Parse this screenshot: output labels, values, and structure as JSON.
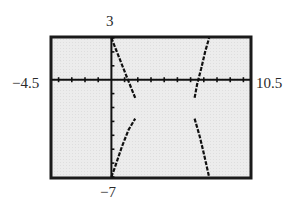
{
  "chart_data": {
    "type": "line",
    "title": "",
    "xlabel": "",
    "ylabel": "",
    "window": {
      "xmin": -4.5,
      "xmax": 10.5,
      "ymin": -7,
      "ymax": 3,
      "xscl": 1,
      "yscl": 1
    },
    "labels": {
      "ymax": "3",
      "ymin": "−7",
      "xmin": "−4.5",
      "xmax": "10.5"
    },
    "grid": false,
    "style": "graphing-calculator screen, dashed/pixelated curves on light gray background",
    "asymptotes_x": [
      1.7,
      6.5
    ],
    "series": [
      {
        "name": "branch-1-upper-left",
        "points": [
          [
            0,
            3
          ],
          [
            0.5,
            1.8
          ],
          [
            1.0,
            0.6
          ],
          [
            1.5,
            -0.6
          ],
          [
            1.8,
            -1.3
          ]
        ]
      },
      {
        "name": "branch-2-lower-left",
        "points": [
          [
            0,
            -7
          ],
          [
            0.3,
            -6.2
          ],
          [
            0.8,
            -4.8
          ],
          [
            1.3,
            -3.6
          ],
          [
            1.8,
            -2.8
          ]
        ]
      },
      {
        "name": "branch-3-upper-right",
        "points": [
          [
            6.3,
            -1.3
          ],
          [
            6.5,
            -0.3
          ],
          [
            6.8,
            0.8
          ],
          [
            7.1,
            2.0
          ],
          [
            7.4,
            3
          ]
        ]
      },
      {
        "name": "branch-4-lower-right",
        "points": [
          [
            6.3,
            -2.8
          ],
          [
            6.7,
            -4.1
          ],
          [
            7.0,
            -5.3
          ],
          [
            7.4,
            -7
          ]
        ]
      }
    ],
    "y_axis_segment": {
      "x": 0,
      "from": -7,
      "to": 3
    }
  }
}
